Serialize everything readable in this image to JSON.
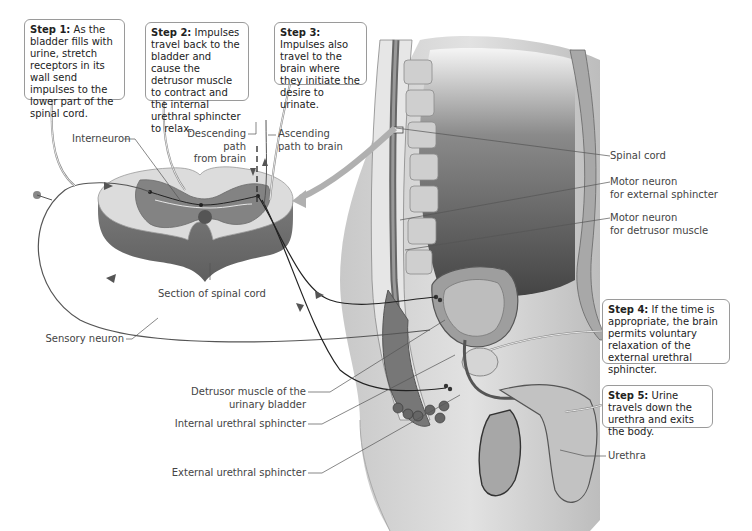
{
  "diagram": {
    "steps": [
      {
        "label": "Step 1:",
        "text": "As the bladder fills with urine, stretch receptors in its wall send impulses to the lower part of the spinal cord."
      },
      {
        "label": "Step 2:",
        "text": "Impulses travel back to the bladder and cause the detrusor muscle to contract and the internal urethral sphincter to relax."
      },
      {
        "label": "Step 3:",
        "text": "Impulses also travel to the brain where they initiate the desire to urinate."
      },
      {
        "label": "Step 4:",
        "text": "If the time is appropriate, the brain permits voluntary relaxation of the external urethral sphincter."
      },
      {
        "label": "Step 5:",
        "text": "Urine travels down the urethra and exits the body."
      }
    ],
    "labels": {
      "interneuron": "Interneuron",
      "descending_path": "Descending path\nfrom brain",
      "ascending_path": "Ascending\npath to brain",
      "section_spinal_cord": "Section of spinal cord",
      "sensory_neuron": "Sensory neuron",
      "spinal_cord": "Spinal cord",
      "motor_neuron_external": "Motor neuron\nfor external sphincter",
      "motor_neuron_detrusor": "Motor neuron\nfor detrusor muscle",
      "detrusor_muscle": "Detrusor muscle of the\nurinary bladder",
      "internal_sphincter": "Internal urethral sphincter",
      "external_sphincter": "External urethral sphincter",
      "urethra": "Urethra"
    },
    "colors": {
      "tissue_dark": "#5a5a5a",
      "tissue_mid": "#9a9a9a",
      "tissue_light": "#d4d4d4",
      "callout_border": "#9a9a9a",
      "leader_line": "#555555"
    }
  }
}
